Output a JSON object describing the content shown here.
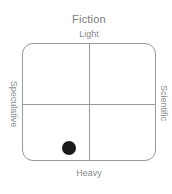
{
  "chart_data": {
    "type": "scatter",
    "title": "Fiction",
    "axes": {
      "top": "Light",
      "bottom": "Heavy",
      "left": "Speculative",
      "right": "Scientific"
    },
    "xlabel": "Speculative ↔ Scientific",
    "ylabel": "Heavy ↔ Light",
    "xlim": [
      -1,
      1
    ],
    "ylim": [
      -1,
      1
    ],
    "grid": "quadrant dividers at center",
    "legend": null,
    "points": [
      {
        "x": -0.3,
        "y": -0.75,
        "color": "#1a1a1a"
      }
    ]
  },
  "title": "Fiction",
  "labels": {
    "top": "Light",
    "bottom": "Heavy",
    "left": "Speculative",
    "right": "Scientific"
  },
  "colors": {
    "frame": "#9a9a9a",
    "point": "#1a1a1a",
    "text": "#7a7a7a"
  }
}
